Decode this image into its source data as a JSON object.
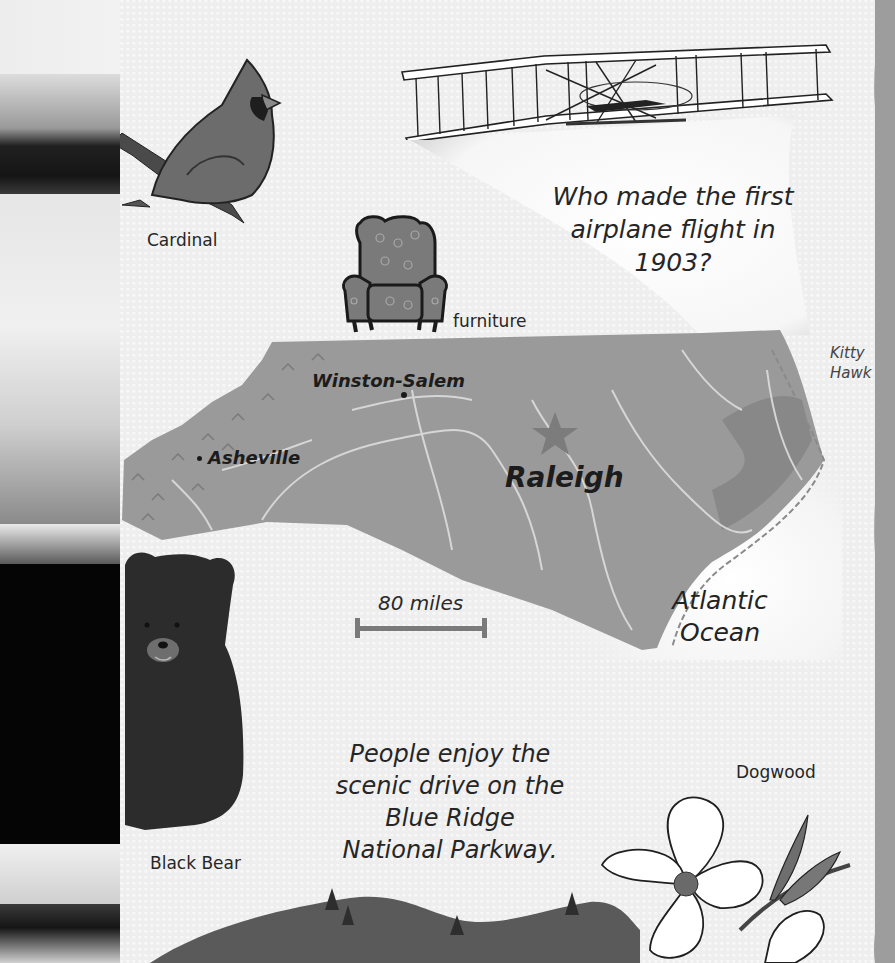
{
  "map": {
    "region": "North Carolina",
    "cities": [
      {
        "name": "Winston-Salem",
        "type": "city"
      },
      {
        "name": "Asheville",
        "type": "city"
      },
      {
        "name": "Raleigh",
        "type": "capital"
      }
    ],
    "places": {
      "kitty_hawk_line1": "Kitty",
      "kitty_hawk_line2": "Hawk",
      "ocean_line1": "Atlantic",
      "ocean_line2": "Ocean"
    },
    "scale": {
      "label": "80 miles"
    }
  },
  "captions": {
    "cardinal": "Cardinal",
    "furniture": "furniture",
    "black_bear": "Black Bear",
    "dogwood": "Dogwood"
  },
  "question": {
    "line1": "Who made the first",
    "line2": "airplane flight in",
    "line3": "1903?"
  },
  "parkway": {
    "line1": "People enjoy the",
    "line2": "scenic drive on the",
    "line3": "Blue Ridge",
    "line4": "National Parkway."
  },
  "colors": {
    "paper": "#eeeeee",
    "land": "#9a9a9a",
    "river": "#d8d8d8",
    "edge": "#9d9d9d",
    "ink": "#1e1e1e"
  }
}
